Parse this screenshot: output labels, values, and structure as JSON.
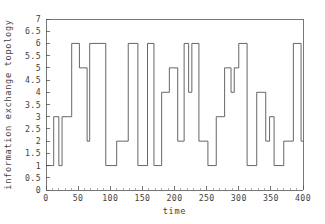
{
  "chart_data": {
    "type": "line",
    "line_style": "step-post",
    "title": "",
    "xlabel": "time",
    "ylabel": "information exchange topology",
    "xlim": [
      0,
      400
    ],
    "ylim": [
      0,
      7
    ],
    "grid": false,
    "legend": null,
    "x_ticks": [
      0,
      50,
      100,
      150,
      200,
      250,
      300,
      350,
      400
    ],
    "x_tick_labels": [
      "0",
      "50",
      "100",
      "150",
      "200",
      "250",
      "300",
      "350",
      "400"
    ],
    "x_minor_tick_step": 10,
    "y_ticks": [
      0,
      0.5,
      1,
      1.5,
      2,
      2.5,
      3,
      3.5,
      4,
      4.5,
      5,
      5.5,
      6,
      6.5,
      7
    ],
    "y_tick_labels": [
      "0",
      "0.5",
      "1",
      "1.5",
      "2",
      "2.5",
      "3",
      "3.5",
      "4",
      "4.5",
      "5",
      "5.5",
      "6",
      "6.5",
      "7"
    ],
    "series": [
      {
        "name": "information exchange topology",
        "color": "#4a4a4a",
        "x": [
          0,
          12,
          20,
          25,
          32,
          40,
          45,
          52,
          58,
          64,
          68,
          75,
          88,
          93,
          100,
          110,
          120,
          128,
          133,
          143,
          150,
          158,
          163,
          168,
          175,
          180,
          185,
          192,
          197,
          205,
          210,
          215,
          218,
          222,
          227,
          232,
          238,
          243,
          248,
          252,
          258,
          265,
          272,
          278,
          283,
          288,
          293,
          300,
          308,
          313,
          320,
          328,
          335,
          342,
          348,
          355,
          362,
          370,
          377,
          385,
          392,
          397,
          400
        ],
        "y": [
          1,
          3,
          1,
          3,
          3,
          6,
          6,
          5,
          5,
          2,
          6,
          6,
          6,
          1,
          1,
          2,
          2,
          6,
          6,
          1,
          1,
          6,
          6,
          1,
          1,
          4,
          4,
          5,
          5,
          2,
          2,
          6,
          6,
          4,
          6,
          6,
          2,
          2,
          2,
          1,
          1,
          3,
          3,
          5,
          5,
          4,
          5,
          6,
          6,
          1,
          1,
          4,
          4,
          2,
          2,
          3,
          3,
          1,
          1,
          2,
          6,
          6,
          2
        ],
        "steps": [
          {
            "from": 0,
            "to": 12,
            "value": 1
          },
          {
            "from": 12,
            "to": 20,
            "value": 3
          },
          {
            "from": 20,
            "to": 25,
            "value": 1
          },
          {
            "from": 25,
            "to": 40,
            "value": 3
          },
          {
            "from": 40,
            "to": 52,
            "value": 6
          },
          {
            "from": 52,
            "to": 64,
            "value": 5
          },
          {
            "from": 64,
            "to": 68,
            "value": 2
          },
          {
            "from": 68,
            "to": 93,
            "value": 6
          },
          {
            "from": 93,
            "to": 110,
            "value": 1
          },
          {
            "from": 110,
            "to": 128,
            "value": 2
          },
          {
            "from": 128,
            "to": 143,
            "value": 6
          },
          {
            "from": 143,
            "to": 158,
            "value": 1
          },
          {
            "from": 158,
            "to": 168,
            "value": 6
          },
          {
            "from": 168,
            "to": 180,
            "value": 1
          },
          {
            "from": 180,
            "to": 192,
            "value": 4
          },
          {
            "from": 192,
            "to": 205,
            "value": 5
          },
          {
            "from": 205,
            "to": 215,
            "value": 2
          },
          {
            "from": 215,
            "to": 222,
            "value": 6
          },
          {
            "from": 222,
            "to": 227,
            "value": 4
          },
          {
            "from": 227,
            "to": 238,
            "value": 6
          },
          {
            "from": 238,
            "to": 252,
            "value": 2
          },
          {
            "from": 252,
            "to": 265,
            "value": 1
          },
          {
            "from": 265,
            "to": 278,
            "value": 3
          },
          {
            "from": 278,
            "to": 288,
            "value": 5
          },
          {
            "from": 288,
            "to": 293,
            "value": 4
          },
          {
            "from": 293,
            "to": 300,
            "value": 5
          },
          {
            "from": 300,
            "to": 313,
            "value": 6
          },
          {
            "from": 313,
            "to": 328,
            "value": 1
          },
          {
            "from": 328,
            "to": 342,
            "value": 4
          },
          {
            "from": 342,
            "to": 348,
            "value": 2
          },
          {
            "from": 348,
            "to": 355,
            "value": 3
          },
          {
            "from": 355,
            "to": 370,
            "value": 1
          },
          {
            "from": 370,
            "to": 385,
            "value": 2
          },
          {
            "from": 385,
            "to": 397,
            "value": 6
          },
          {
            "from": 397,
            "to": 400,
            "value": 2
          }
        ]
      }
    ]
  },
  "layout": {
    "plot_left": 46,
    "plot_right": 303,
    "plot_top": 19,
    "plot_bottom": 190,
    "axis_color": "#555555",
    "line_color": "#4a4a4a",
    "background": "#ffffff"
  }
}
